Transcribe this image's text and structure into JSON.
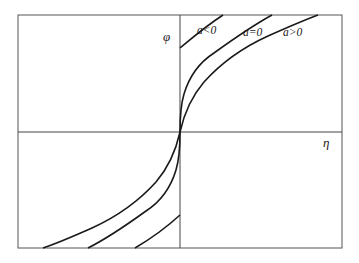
{
  "figure": {
    "type": "phase-curve-diagram",
    "axes": {
      "x_label": "η",
      "y_label": "φ"
    },
    "curves": [
      {
        "name": "a<0",
        "label": "a<0"
      },
      {
        "name": "a=0",
        "label": "a=0"
      },
      {
        "name": "a>0",
        "label": "a>0"
      }
    ],
    "colors": {
      "stroke": "#1a1a1a",
      "frame": "#555555",
      "background": "#ffffff"
    }
  }
}
